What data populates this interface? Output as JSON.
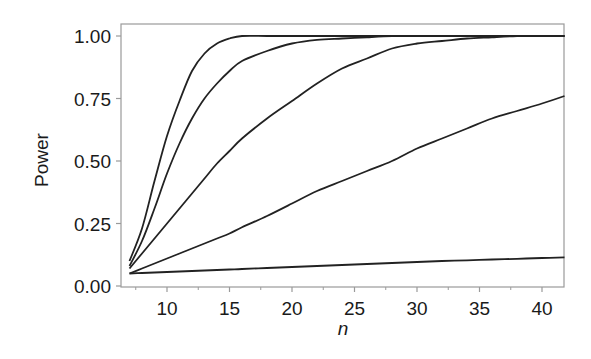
{
  "chart_data": {
    "type": "line",
    "title": "",
    "xlabel": "n",
    "ylabel": "Power",
    "xlim": [
      6.3,
      41.8
    ],
    "ylim": [
      -0.03,
      1.05
    ],
    "xticks": [
      10,
      15,
      20,
      25,
      30,
      35,
      40
    ],
    "xtick_labels": [
      "10",
      "15",
      "20",
      "25",
      "30",
      "35",
      "40"
    ],
    "xminor_ticks": [
      7.5,
      12.5,
      17.5,
      22.5,
      27.5,
      32.5,
      37.5
    ],
    "yticks": [
      0.0,
      0.25,
      0.5,
      0.75,
      1.0
    ],
    "ytick_labels": [
      "0.00",
      "0.25",
      "0.50",
      "0.75",
      "1.00"
    ],
    "grid": false,
    "legend": null,
    "x": [
      7,
      8,
      9,
      10,
      11,
      12,
      13,
      14,
      15,
      16,
      18,
      20,
      22,
      24,
      26,
      28,
      30,
      32,
      34,
      36,
      38,
      40,
      41.8
    ],
    "series": [
      {
        "name": "curve 1",
        "values": [
          0.1,
          0.23,
          0.42,
          0.6,
          0.74,
          0.86,
          0.93,
          0.97,
          0.99,
          1.0,
          1.0,
          1.0,
          1.0,
          1.0,
          1.0,
          1.0,
          1.0,
          1.0,
          1.0,
          1.0,
          1.0,
          1.0,
          1.0
        ]
      },
      {
        "name": "curve 2",
        "values": [
          0.08,
          0.18,
          0.31,
          0.45,
          0.57,
          0.67,
          0.75,
          0.81,
          0.86,
          0.9,
          0.94,
          0.97,
          0.985,
          0.99,
          0.995,
          1.0,
          1.0,
          1.0,
          1.0,
          1.0,
          1.0,
          1.0,
          1.0
        ]
      },
      {
        "name": "curve 3",
        "values": [
          0.07,
          0.13,
          0.19,
          0.25,
          0.31,
          0.37,
          0.43,
          0.49,
          0.54,
          0.59,
          0.67,
          0.74,
          0.81,
          0.87,
          0.91,
          0.95,
          0.97,
          0.98,
          0.99,
          0.995,
          1.0,
          1.0,
          1.0
        ]
      },
      {
        "name": "curve 4",
        "values": [
          0.05,
          0.07,
          0.09,
          0.11,
          0.13,
          0.15,
          0.17,
          0.19,
          0.21,
          0.235,
          0.28,
          0.33,
          0.38,
          0.42,
          0.46,
          0.5,
          0.55,
          0.59,
          0.63,
          0.67,
          0.7,
          0.73,
          0.76
        ]
      },
      {
        "name": "curve 5",
        "values": [
          0.05,
          0.052,
          0.054,
          0.056,
          0.058,
          0.06,
          0.062,
          0.064,
          0.066,
          0.068,
          0.072,
          0.076,
          0.08,
          0.084,
          0.088,
          0.092,
          0.096,
          0.1,
          0.103,
          0.106,
          0.109,
          0.112,
          0.115
        ]
      }
    ]
  },
  "style": {
    "line_color": "#222222",
    "axis_color": "#9a9a9a",
    "text_color": "#1a1a1a"
  }
}
